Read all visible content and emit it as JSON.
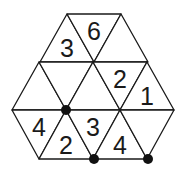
{
  "puzzle": {
    "type": "triangular-grid-number-puzzle",
    "rows": [
      {
        "row": 1,
        "cells": [
          {
            "orientation": "up",
            "value": "3"
          },
          {
            "orientation": "down",
            "value": "6"
          },
          {
            "orientation": "up",
            "value": ""
          }
        ]
      },
      {
        "row": 2,
        "cells": [
          {
            "orientation": "up",
            "value": ""
          },
          {
            "orientation": "down",
            "value": ""
          },
          {
            "orientation": "up",
            "value": ""
          },
          {
            "orientation": "down",
            "value": "2"
          },
          {
            "orientation": "up",
            "value": "1"
          }
        ]
      },
      {
        "row": 3,
        "cells": [
          {
            "orientation": "down",
            "value": "4"
          },
          {
            "orientation": "up",
            "value": "2"
          },
          {
            "orientation": "down",
            "value": "3"
          },
          {
            "orientation": "up",
            "value": "4"
          },
          {
            "orientation": "down",
            "value": ""
          }
        ]
      }
    ],
    "dots": [
      {
        "between_rows": [
          1,
          2
        ],
        "vertex_index": 1
      },
      {
        "between_rows": [
          2,
          3
        ],
        "vertex_index": 1
      },
      {
        "between_rows": [
          2,
          3
        ],
        "vertex_index": 2
      }
    ],
    "colors": {
      "line": "#1a1a1a",
      "dot": "#111111",
      "background": "#ffffff"
    }
  }
}
